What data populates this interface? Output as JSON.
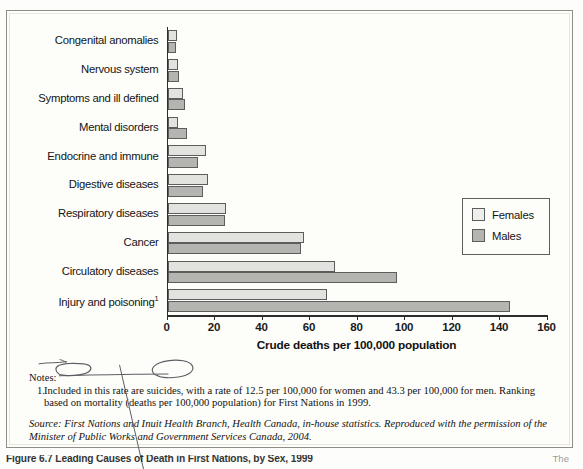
{
  "chart_data": {
    "type": "bar",
    "orientation": "horizontal",
    "title": "",
    "xlabel": "Crude deaths per 100,000 population",
    "ylabel": "",
    "xlim": [
      0,
      160
    ],
    "xticks": [
      0,
      20,
      40,
      60,
      80,
      100,
      120,
      140,
      160
    ],
    "grid": false,
    "legend_position": "center-right",
    "categories": [
      "Congenital anomalies",
      "Nervous system",
      "Symptoms and ill defined",
      "Mental disorders",
      "Endocrine and immune",
      "Digestive diseases",
      "Respiratory diseases",
      "Cancer",
      "Circulatory diseases",
      "Injury and poisoning"
    ],
    "category_footnote_marks": {
      "Injury and poisoning": "1"
    },
    "series": [
      {
        "name": "Females",
        "color": "#e2e2df",
        "values": [
          4,
          4.5,
          6.5,
          4.5,
          16,
          17,
          24.5,
          57.5,
          70.5,
          67
        ]
      },
      {
        "name": "Males",
        "color": "#b4b4b1",
        "values": [
          3.5,
          5,
          7.5,
          8,
          13,
          15,
          24,
          56,
          96.5,
          144
        ]
      }
    ]
  },
  "legend": {
    "items": [
      {
        "label": "Females",
        "swatch": "females"
      },
      {
        "label": "Males",
        "swatch": "males"
      }
    ]
  },
  "notes": {
    "heading": "Notes:",
    "items": [
      {
        "number": "1.",
        "text": "Included in this rate are suicides, with a rate of 12.5 per 100,000 for women and 43.3 per 100,000 for men. Ranking based on mortality (deaths per 100,000 population) for First Nations in 1999."
      }
    ],
    "source": "Source: First Nations and Inuit Health Branch, Health Canada, in-house statistics. Reproduced with the permission of the Minister of Public Works and Government Services Canada, 2004."
  },
  "caption": {
    "text": "Figure 6.7  Leading Causes of Death in First Nations, by Sex, 1999",
    "trailing": "The"
  },
  "annotations": {
    "pen_color": "#5d5f63",
    "marks": [
      {
        "kind": "ellipse",
        "target": "Included"
      },
      {
        "kind": "ellipse",
        "target": "suicides"
      },
      {
        "kind": "underline",
        "target": "Included in this rate are suicides,"
      },
      {
        "kind": "strikethrough",
        "target": "Notes:"
      },
      {
        "kind": "long-diagonal-line",
        "target": "margin-pointer"
      }
    ]
  },
  "colors": {
    "females_fill": "#e2e2df",
    "males_fill": "#b4b4b1",
    "bar_stroke": "#5d5d5d",
    "axis": "#2d2d2d",
    "page_border": "#8f8d86",
    "text": "#141414"
  }
}
